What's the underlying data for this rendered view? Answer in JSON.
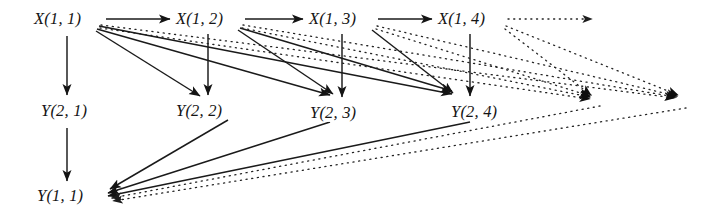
{
  "figure": {
    "kind": "directed-graph-diagram",
    "background_color": "#ffffff",
    "ink_color": "#141414",
    "solid_edge_color": "#1a1a1a",
    "dotted_edge_color": "#2b2b2b"
  },
  "nodes": [
    {
      "id": "x11",
      "label": "X(1, 1)",
      "var": "X",
      "i": "1",
      "j": "1",
      "x": 33,
      "y": 10,
      "row": "top"
    },
    {
      "id": "x12",
      "label": "X(1, 2)",
      "var": "X",
      "i": "1",
      "j": "2",
      "x": 175,
      "y": 10,
      "row": "top"
    },
    {
      "id": "x13",
      "label": "X(1, 3)",
      "var": "X",
      "i": "1",
      "j": "3",
      "x": 308,
      "y": 10,
      "row": "top"
    },
    {
      "id": "x14",
      "label": "X(1, 4)",
      "var": "X",
      "i": "1",
      "j": "4",
      "x": 437,
      "y": 10,
      "row": "top"
    },
    {
      "id": "y21",
      "label": "Y(2, 1)",
      "var": "Y",
      "i": "2",
      "j": "1",
      "x": 40,
      "y": 102,
      "row": "middle"
    },
    {
      "id": "y22",
      "label": "Y(2, 2)",
      "var": "Y",
      "i": "2",
      "j": "2",
      "x": 175,
      "y": 102,
      "row": "middle"
    },
    {
      "id": "y23",
      "label": "Y(2, 3)",
      "var": "Y",
      "i": "2",
      "j": "3",
      "x": 309,
      "y": 104,
      "row": "middle"
    },
    {
      "id": "y24",
      "label": "Y(2, 4)",
      "var": "Y",
      "i": "2",
      "j": "4",
      "x": 450,
      "y": 103,
      "row": "middle"
    },
    {
      "id": "y11",
      "label": "Y(1, 1)",
      "var": "Y",
      "i": "1",
      "j": "1",
      "x": 36,
      "y": 187,
      "row": "bottom"
    }
  ],
  "edges_solid": [
    {
      "name": "x11-to-x12",
      "from": "x11",
      "to": "x12",
      "style": "solid",
      "kind": "horizontal"
    },
    {
      "name": "x12-to-x13",
      "from": "x12",
      "to": "x13",
      "style": "solid",
      "kind": "horizontal"
    },
    {
      "name": "x13-to-x14",
      "from": "x13",
      "to": "x14",
      "style": "solid",
      "kind": "horizontal"
    },
    {
      "name": "x11-to-y21",
      "from": "x11",
      "to": "y21",
      "style": "solid",
      "kind": "vertical"
    },
    {
      "name": "x12-to-y22",
      "from": "x12",
      "to": "y22",
      "style": "solid",
      "kind": "vertical"
    },
    {
      "name": "x13-to-y23",
      "from": "x13",
      "to": "y23",
      "style": "solid",
      "kind": "vertical"
    },
    {
      "name": "x14-to-y24",
      "from": "x14",
      "to": "y24",
      "style": "solid",
      "kind": "vertical"
    },
    {
      "name": "y21-to-y11",
      "from": "y21",
      "to": "y11",
      "style": "solid",
      "kind": "vertical"
    },
    {
      "name": "x11-to-y22",
      "from": "x11",
      "to": "y22",
      "style": "solid",
      "kind": "diagonal"
    },
    {
      "name": "x11-to-y23",
      "from": "x11",
      "to": "y23",
      "style": "solid",
      "kind": "diagonal"
    },
    {
      "name": "x11-to-y24",
      "from": "x11",
      "to": "y24",
      "style": "solid",
      "kind": "diagonal"
    },
    {
      "name": "x12-to-y23",
      "from": "x12",
      "to": "y23",
      "style": "solid",
      "kind": "diagonal"
    },
    {
      "name": "x12-to-y24",
      "from": "x12",
      "to": "y24",
      "style": "solid",
      "kind": "diagonal"
    },
    {
      "name": "x13-to-y24",
      "from": "x13",
      "to": "y24",
      "style": "solid",
      "kind": "diagonal"
    },
    {
      "name": "y22-to-y11",
      "from": "y22",
      "to": "y11",
      "style": "solid",
      "kind": "diagonal"
    },
    {
      "name": "y23-to-y11",
      "from": "y23",
      "to": "y11",
      "style": "solid",
      "kind": "diagonal"
    },
    {
      "name": "y24-to-y11",
      "from": "y24",
      "to": "y11",
      "style": "solid",
      "kind": "diagonal"
    }
  ],
  "edges_dotted": [
    {
      "name": "x14-to-next",
      "from": "x14",
      "to": "offscreen-top",
      "style": "dotted",
      "kind": "horizontal"
    },
    {
      "name": "x11-to-offscreen-a",
      "from": "x11",
      "to": "offscreen-mid-1",
      "style": "dotted",
      "kind": "diagonal"
    },
    {
      "name": "x11-to-offscreen-b",
      "from": "x11",
      "to": "offscreen-mid-2",
      "style": "dotted",
      "kind": "diagonal"
    },
    {
      "name": "x12-to-offscreen-a",
      "from": "x12",
      "to": "offscreen-mid-1",
      "style": "dotted",
      "kind": "diagonal"
    },
    {
      "name": "x12-to-offscreen-b",
      "from": "x12",
      "to": "offscreen-mid-2",
      "style": "dotted",
      "kind": "diagonal"
    },
    {
      "name": "x13-to-offscreen-a",
      "from": "x13",
      "to": "offscreen-mid-1",
      "style": "dotted",
      "kind": "diagonal"
    },
    {
      "name": "x13-to-offscreen-b",
      "from": "x13",
      "to": "offscreen-mid-2",
      "style": "dotted",
      "kind": "diagonal"
    },
    {
      "name": "x14-to-offscreen-a",
      "from": "x14",
      "to": "offscreen-mid-1",
      "style": "dotted",
      "kind": "diagonal"
    },
    {
      "name": "x14-to-offscreen-b",
      "from": "x14",
      "to": "offscreen-mid-2",
      "style": "dotted",
      "kind": "diagonal"
    },
    {
      "name": "offscreen-mid-1-to-y11",
      "from": "offscreen-mid-1",
      "to": "y11",
      "style": "dotted",
      "kind": "diagonal"
    },
    {
      "name": "offscreen-mid-2-to-y11",
      "from": "offscreen-mid-2",
      "to": "y11",
      "style": "dotted",
      "kind": "diagonal"
    }
  ],
  "continuation_markers": [
    {
      "name": "top-row-continuation-arrowhead",
      "x": 596,
      "y": 18
    },
    {
      "name": "middle-row-continuation-arrowhead-1",
      "x": 596,
      "y": 100
    },
    {
      "name": "middle-row-continuation-arrowhead-2",
      "x": 681,
      "y": 100
    }
  ]
}
